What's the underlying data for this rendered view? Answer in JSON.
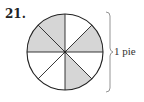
{
  "problem": {
    "number": "21.",
    "brace_label": "1 pie"
  },
  "pie": {
    "total_slices": 8,
    "shaded_slices": 4,
    "shaded_slice_positions": [
      "12 to 10:30",
      "10:30 to 9",
      "1:30 to 3",
      "4:30 to 6"
    ],
    "colors": {
      "shaded": "#d6d6d6",
      "unshaded": "#ffffff",
      "stroke": "#222222"
    }
  }
}
